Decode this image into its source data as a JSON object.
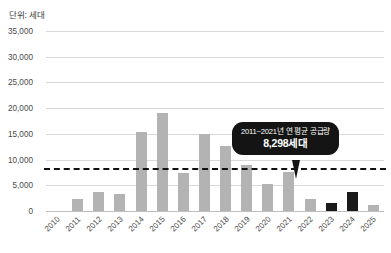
{
  "unit_label": "단위: 세대",
  "callout": {
    "line1": "2011~2021년 연 평균 공급량",
    "line2": "8,298세대"
  },
  "colors": {
    "bar_default": "#b3b3b3",
    "bar_highlight": "#1a1a1a",
    "gridline": "#d8d8d8",
    "avg_line": "#111111",
    "callout_bg": "#141414",
    "callout_text": "#ffffff"
  },
  "chart_data": {
    "type": "bar",
    "title": "",
    "subtitle": "",
    "xlabel": "",
    "ylabel": "단위: 세대",
    "ylim": [
      0,
      35000
    ],
    "ytick_labels": [
      "35,000",
      "30,000",
      "25,000",
      "20,000",
      "15,000",
      "10,000",
      "5,000",
      "0"
    ],
    "ytick_values": [
      35000,
      30000,
      25000,
      20000,
      15000,
      10000,
      5000,
      0
    ],
    "grid": true,
    "legend": "none",
    "categories": [
      "2010",
      "2011",
      "2012",
      "2013",
      "2014",
      "2015",
      "2016",
      "2017",
      "2018",
      "2019",
      "2020",
      "2021",
      "2022",
      "2023",
      "2024",
      "2025"
    ],
    "values": [
      0,
      2300,
      3700,
      3400,
      15400,
      19100,
      7300,
      14900,
      12600,
      8900,
      5200,
      7600,
      2300,
      1600,
      3700,
      1100
    ],
    "highlighted": [
      "2023",
      "2024"
    ],
    "annotations": [
      {
        "type": "hline",
        "value": 8298,
        "label": "2011~2021년 연 평균 공급량",
        "value_label": "8,298세대",
        "style": "dashed"
      }
    ]
  }
}
